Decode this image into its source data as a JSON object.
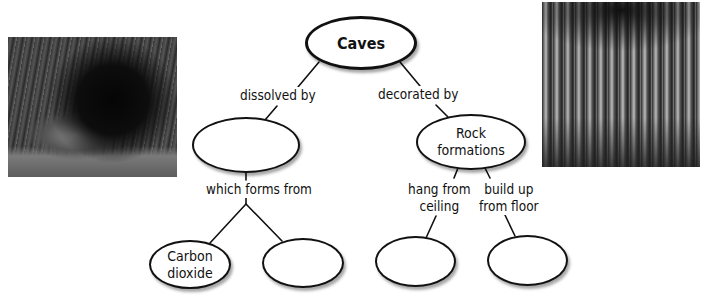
{
  "diagram": {
    "type": "concept-map",
    "root": {
      "label": "Caves"
    },
    "nodes": [
      {
        "id": "caves",
        "label": "Caves"
      },
      {
        "id": "dissolver",
        "label": ""
      },
      {
        "id": "rock_formations",
        "label": "Rock formations",
        "line1": "Rock",
        "line2": "formations"
      },
      {
        "id": "carbon_dioxide",
        "label": "Carbon dioxide",
        "line1": "Carbon",
        "line2": "dioxide"
      },
      {
        "id": "source2",
        "label": ""
      },
      {
        "id": "hanging",
        "label": ""
      },
      {
        "id": "building",
        "label": ""
      }
    ],
    "links": [
      {
        "from": "caves",
        "to": "dissolver",
        "label": "dissolved by"
      },
      {
        "from": "caves",
        "to": "rock_formations",
        "label": "decorated by"
      },
      {
        "from": "dissolver",
        "to": [
          "carbon_dioxide",
          "source2"
        ],
        "label": "which forms from"
      },
      {
        "from": "rock_formations",
        "to": "hanging",
        "label": "hang from ceiling",
        "line1": "hang from",
        "line2": "ceiling"
      },
      {
        "from": "rock_formations",
        "to": "building",
        "label": "build up from floor",
        "line1": "build up",
        "line2": "from floor"
      }
    ]
  },
  "photos": [
    {
      "position": "left",
      "subject": "cave-entrance-photo"
    },
    {
      "position": "right",
      "subject": "stalactite-formations-photo"
    }
  ],
  "colors": {
    "line": "#111111",
    "node_fill": "#ffffff",
    "text": "#111111",
    "background": "#ffffff"
  }
}
